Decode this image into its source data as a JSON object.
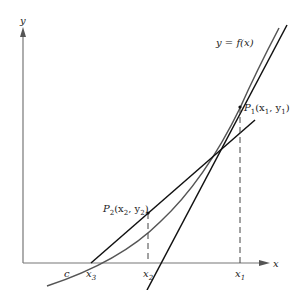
{
  "diagram": {
    "axes": {
      "x_label": "x",
      "y_label": "y",
      "color": "#777777"
    },
    "curve": {
      "label": "y = f(x)",
      "color": "#555555"
    },
    "points": [
      {
        "name": "P1",
        "label_main": "P",
        "label_sub": "1",
        "label_rest": "(x",
        "label_sub2": "1",
        "label_mid": ", y",
        "label_sub3": "1",
        "label_end": ")"
      },
      {
        "name": "P2",
        "label_main": "P",
        "label_sub": "2",
        "label_rest": "(x",
        "label_sub2": "2",
        "label_mid": ", y",
        "label_sub3": "2",
        "label_end": ")"
      }
    ],
    "x_ticks": [
      {
        "id": "c",
        "label": "c",
        "sub": ""
      },
      {
        "id": "x3",
        "label": "x",
        "sub": "3"
      },
      {
        "id": "x2",
        "label": "x",
        "sub": "2"
      },
      {
        "id": "x1",
        "label": "x",
        "sub": "1"
      }
    ],
    "tangent_color": "#111111",
    "dash_color": "#444444"
  }
}
